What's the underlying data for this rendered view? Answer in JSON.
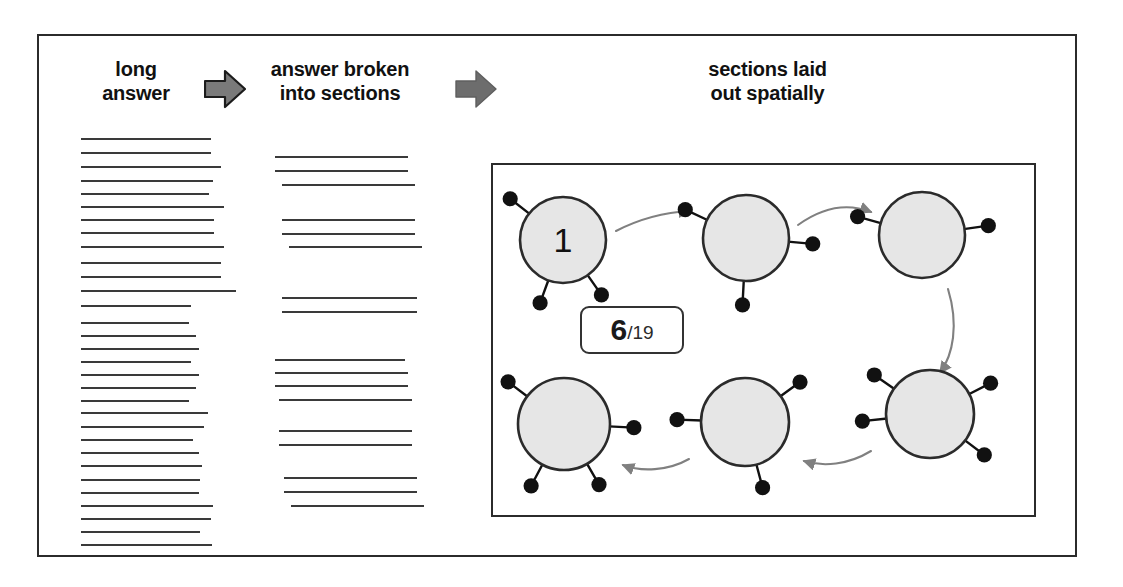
{
  "figure": {
    "headings": [
      {
        "id": "long-answer",
        "text": "long\nanswer"
      },
      {
        "id": "answer-broken",
        "text": "answer broken\ninto sections"
      },
      {
        "id": "sections-spatial",
        "text": "sections laid\nout spatially"
      }
    ],
    "arrows": [
      {
        "id": "block-arrow-1",
        "icon": "right-block-arrow-icon",
        "fill": "#7a7a7a",
        "stroke": "#1c1c1c"
      },
      {
        "id": "block-arrow-2",
        "icon": "right-block-arrow-icon",
        "fill": "#6d6d6d",
        "stroke": "#6d6d6d"
      }
    ],
    "counter": {
      "current": "6",
      "separator": "/",
      "total": "19"
    },
    "colors": {
      "frame": "#2b2b2b",
      "line": "#3a3a3a",
      "node_fill": "#e6e6e6",
      "node_stroke": "#2b2b2b",
      "dot": "#111111",
      "flow_arrow": "#808080",
      "text": "#111111"
    },
    "long_answer_lines": [
      {
        "y": 0,
        "w": 130
      },
      {
        "y": 14,
        "w": 130
      },
      {
        "y": 28,
        "w": 140
      },
      {
        "y": 42,
        "w": 132
      },
      {
        "y": 55,
        "w": 128
      },
      {
        "y": 68,
        "w": 143
      },
      {
        "y": 81,
        "w": 133
      },
      {
        "y": 94,
        "w": 133
      },
      {
        "y": 108,
        "w": 143
      },
      {
        "y": 124,
        "w": 140
      },
      {
        "y": 138,
        "w": 140
      },
      {
        "y": 152,
        "w": 155
      },
      {
        "y": 167,
        "w": 110
      },
      {
        "y": 184,
        "w": 108
      },
      {
        "y": 197,
        "w": 115
      },
      {
        "y": 210,
        "w": 118
      },
      {
        "y": 223,
        "w": 110
      },
      {
        "y": 236,
        "w": 118
      },
      {
        "y": 249,
        "w": 115
      },
      {
        "y": 262,
        "w": 108
      },
      {
        "y": 274,
        "w": 127
      },
      {
        "y": 288,
        "w": 123
      },
      {
        "y": 301,
        "w": 112
      },
      {
        "y": 314,
        "w": 118
      },
      {
        "y": 327,
        "w": 121
      },
      {
        "y": 341,
        "w": 119
      },
      {
        "y": 354,
        "w": 118
      },
      {
        "y": 367,
        "w": 132
      },
      {
        "y": 380,
        "w": 130
      },
      {
        "y": 393,
        "w": 119
      },
      {
        "y": 406,
        "w": 131
      }
    ],
    "section_groups": [
      {
        "lines": [
          {
            "y": 0,
            "x": 0,
            "w": 133
          },
          {
            "y": 14,
            "x": 0,
            "w": 133
          },
          {
            "y": 28,
            "x": 7,
            "w": 133
          }
        ]
      },
      {
        "lines": [
          {
            "y": 63,
            "x": 7,
            "w": 133
          },
          {
            "y": 77,
            "x": 7,
            "w": 133
          },
          {
            "y": 90,
            "x": 14,
            "w": 133
          }
        ]
      },
      {
        "lines": [
          {
            "y": 141,
            "x": 7,
            "w": 135
          },
          {
            "y": 155,
            "x": 7,
            "w": 135
          }
        ]
      },
      {
        "lines": [
          {
            "y": 203,
            "x": 0,
            "w": 130
          },
          {
            "y": 216,
            "x": 0,
            "w": 133
          },
          {
            "y": 229,
            "x": 0,
            "w": 133
          },
          {
            "y": 243,
            "x": 4,
            "w": 133
          }
        ]
      },
      {
        "lines": [
          {
            "y": 274,
            "x": 4,
            "w": 133
          },
          {
            "y": 288,
            "x": 4,
            "w": 133
          }
        ]
      },
      {
        "lines": [
          {
            "y": 321,
            "x": 9,
            "w": 133
          },
          {
            "y": 335,
            "x": 9,
            "w": 133
          },
          {
            "y": 349,
            "x": 16,
            "w": 133
          }
        ]
      }
    ],
    "nodes": [
      {
        "id": "node-1",
        "label": "1",
        "cx": 70,
        "cy": 75,
        "r": 43,
        "dots": [
          {
            "a": 218
          },
          {
            "a": 110
          },
          {
            "a": 55
          }
        ]
      },
      {
        "id": "node-2",
        "label": "",
        "cx": 253,
        "cy": 73,
        "r": 43,
        "dots": [
          {
            "a": 205
          },
          {
            "a": 5
          },
          {
            "a": 93
          }
        ]
      },
      {
        "id": "node-3",
        "label": "",
        "cx": 429,
        "cy": 70,
        "r": 43,
        "dots": [
          {
            "a": 196
          },
          {
            "a": 352
          }
        ]
      },
      {
        "id": "node-4",
        "label": "",
        "cx": 71,
        "cy": 259,
        "r": 46,
        "dots": [
          {
            "a": 217
          },
          {
            "a": 3
          },
          {
            "a": 118
          },
          {
            "a": 60
          }
        ]
      },
      {
        "id": "node-5",
        "label": "",
        "cx": 252,
        "cy": 257,
        "r": 44,
        "dots": [
          {
            "a": 182
          },
          {
            "a": 324
          },
          {
            "a": 75
          }
        ]
      },
      {
        "id": "node-6",
        "label": "",
        "cx": 437,
        "cy": 249,
        "r": 44,
        "dots": [
          {
            "a": 215
          },
          {
            "a": 333
          },
          {
            "a": 174
          },
          {
            "a": 37
          }
        ]
      }
    ],
    "flow_arrows": [
      {
        "id": "flow-1-to-2",
        "from": "node-1",
        "to": "node-2"
      },
      {
        "id": "flow-2-to-3",
        "from": "node-2",
        "to": "node-3"
      },
      {
        "id": "flow-3-to-6",
        "from": "node-3",
        "to": "node-6"
      },
      {
        "id": "flow-6-to-5",
        "from": "node-6",
        "to": "node-5"
      },
      {
        "id": "flow-5-to-4",
        "from": "node-5",
        "to": "node-4"
      }
    ]
  }
}
